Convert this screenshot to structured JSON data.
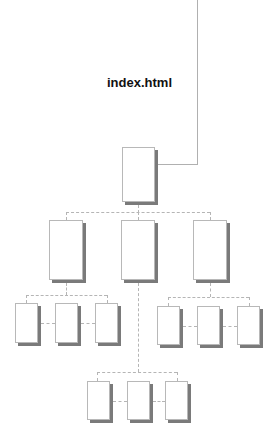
{
  "diagram": {
    "title": "index.html",
    "type": "site-map tree",
    "levels": [
      {
        "level": 1,
        "nodes": 1,
        "label": "index.html root page"
      },
      {
        "level": 2,
        "nodes": 3
      },
      {
        "level": 3,
        "groups": [
          {
            "parent": "level2-left",
            "nodes": 3
          },
          {
            "parent": "level2-right",
            "nodes": 3
          }
        ]
      },
      {
        "level": 4,
        "groups": [
          {
            "parent": "level2-middle",
            "nodes": 3
          }
        ]
      }
    ],
    "colors": {
      "box_border": "#b8b8b8",
      "box_shadow": "#7a7a7a",
      "connector": "#b5b5b5",
      "title_text": "#111111",
      "background": "#ffffff"
    }
  }
}
